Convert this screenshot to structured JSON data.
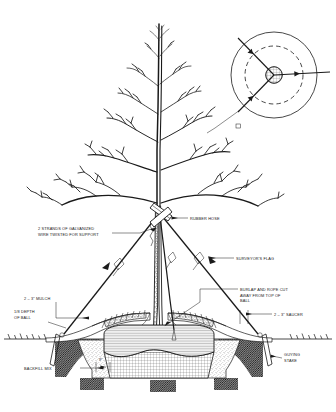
{
  "diagram": {
    "type": "horticultural-cross-section",
    "background_color": "#ffffff",
    "line_color": "#1a1a1a"
  },
  "labels": {
    "rubber_hose": "RUBBER HOSE",
    "galvanized_wire_line1": "2 STRANDS OF GALVANIZED",
    "galvanized_wire_line2": "WIRE TWISTED FOR SUPPORT",
    "surveyors_flag": "SURVEYOR'S FLAG",
    "mulch": "2 – 3\" MULCH",
    "depth_line1": "1/8 DEPTH",
    "depth_line2": "OF BALL",
    "burlap_line1": "BURLAP AND ROPE CUT",
    "burlap_line2": "AWAY FROM TOP OF",
    "burlap_line3": "BALL",
    "saucer": "2 – 3\" SAUCER",
    "guying_stake_line1": "GUYING",
    "guying_stake_line2": "STAKE",
    "backfill_mix": "BACKFILL MIX",
    "dimension_nine": "9\""
  },
  "inset": {
    "name": "plan-view-guying-detail",
    "description": "Plan view circle showing trunk with three guy wires at 120 degrees"
  },
  "components": [
    {
      "name": "tree",
      "label": "deciduous tree, bare branching"
    },
    {
      "name": "trunk",
      "label": "trunk"
    },
    {
      "name": "root-ball",
      "label": "root ball"
    },
    {
      "name": "planting-pit",
      "label": "planting pit"
    },
    {
      "name": "guy-wire",
      "label": "guy wire"
    },
    {
      "name": "ground-line",
      "label": "existing grade"
    }
  ]
}
